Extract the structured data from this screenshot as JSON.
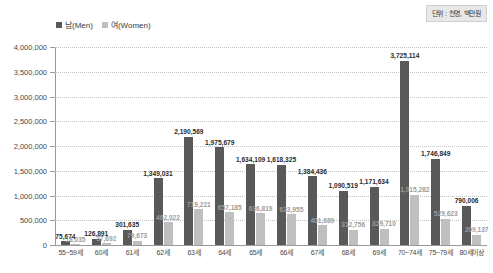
{
  "unit_note": "단위 : 천명, 백만원",
  "legend": {
    "men": "남(Men)",
    "women": "여(Women)",
    "men_color": "#595959",
    "women_color": "#bfbfbf"
  },
  "chart_data": {
    "type": "bar",
    "title": "",
    "subtitle": "",
    "xlabel": "",
    "ylabel": "",
    "ylim": [
      0,
      4000000
    ],
    "ytick_step": 500000,
    "grid": true,
    "legend_position": "top-left",
    "categories": [
      "55~59세",
      "60세",
      "61세",
      "62세",
      "63세",
      "64세",
      "65세",
      "66세",
      "67세",
      "68세",
      "69세",
      "70~74세",
      "75~79세",
      "80세이상"
    ],
    "ytick_labels": [
      "0",
      "500,000",
      "1,000,000",
      "1,500,000",
      "2,000,000",
      "2,500,000",
      "3,000,000",
      "3,500,000",
      "4,000,000"
    ],
    "series": [
      {
        "name": "남(Men)",
        "color": "#595959",
        "values": [
          75674,
          126891,
          301635,
          1349031,
          2190569,
          1975679,
          1634109,
          1618325,
          1384436,
          1090519,
          1171634,
          3725114,
          1746849,
          790006
        ],
        "labels": [
          "75,674",
          "126,891",
          "301,635",
          "1,349,031",
          "2,190,569",
          "1,975,679",
          "1,634,109",
          "1,618,325",
          "1,384,436",
          "1,090,519",
          "1,171,634",
          "3,725,114",
          "1,746,849",
          "790,006"
        ]
      },
      {
        "name": "여(Women)",
        "color": "#bfbfbf",
        "values": [
          18035,
          37692,
          79673,
          462022,
          719221,
          657185,
          636819,
          623955,
          401689,
          312756,
          329710,
          1015282,
          529623,
          209137
        ],
        "labels": [
          "18,035",
          "37,692",
          "79,673",
          "462,022",
          "719,221",
          "657,185",
          "636,819",
          "623,955",
          "401,689",
          "312,756",
          "329,710",
          "1,015,282",
          "529,623",
          "209,137"
        ]
      }
    ]
  }
}
